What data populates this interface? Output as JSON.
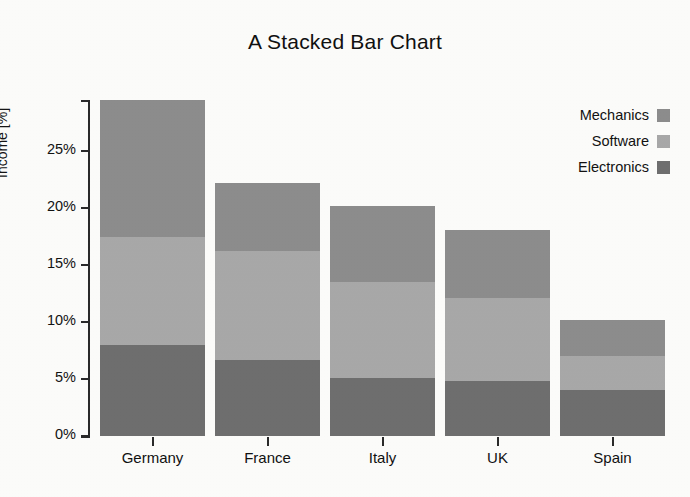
{
  "chart_data": {
    "type": "bar",
    "subtype": "stacked-bar",
    "title": "A Stacked Bar Chart",
    "xlabel": "",
    "ylabel": "Income [%]",
    "categories": [
      "Germany",
      "France",
      "Italy",
      "UK",
      "Spain"
    ],
    "series": [
      {
        "name": "Electronics",
        "color": "#6f6f6f",
        "values": [
          8.0,
          6.7,
          5.1,
          4.8,
          4.0
        ]
      },
      {
        "name": "Software",
        "color": "#a9a9a9",
        "values": [
          9.5,
          9.5,
          8.4,
          7.3,
          3.0
        ]
      },
      {
        "name": "Mechanics",
        "color": "#8d8d8d",
        "values": [
          12.0,
          6.0,
          6.7,
          6.0,
          3.2
        ]
      }
    ],
    "stack_order_bottom_to_top": [
      "Electronics",
      "Software",
      "Mechanics"
    ],
    "totals": [
      29.5,
      22.2,
      20.2,
      18.1,
      10.2
    ],
    "ylim": [
      0,
      29.5
    ],
    "yticks": [
      0,
      5,
      10,
      15,
      20,
      25
    ],
    "ytick_labels": [
      "0%",
      "5%",
      "10%",
      "15%",
      "20%",
      "25%"
    ],
    "grid": false,
    "legend_position": "top-right",
    "legend_entries": [
      "Mechanics",
      "Software",
      "Electronics"
    ]
  },
  "legend": {
    "items": [
      {
        "label": "Mechanics",
        "color": "#8d8d8d"
      },
      {
        "label": "Software",
        "color": "#a9a9a9"
      },
      {
        "label": "Electronics",
        "color": "#6f6f6f"
      }
    ]
  },
  "axes": {
    "y_label": "Income [%]",
    "y_ticks": [
      "0%",
      "5%",
      "10%",
      "15%",
      "20%",
      "25%"
    ],
    "x_ticks": [
      "Germany",
      "France",
      "Italy",
      "UK",
      "Spain"
    ]
  },
  "title": "A Stacked Bar Chart",
  "colors": {
    "background": "#fdfdfb",
    "axis": "#2a2a2a",
    "text": "#111111",
    "mechanics": "#8d8d8d",
    "software": "#a9a9a9",
    "electronics": "#6f6f6f"
  }
}
